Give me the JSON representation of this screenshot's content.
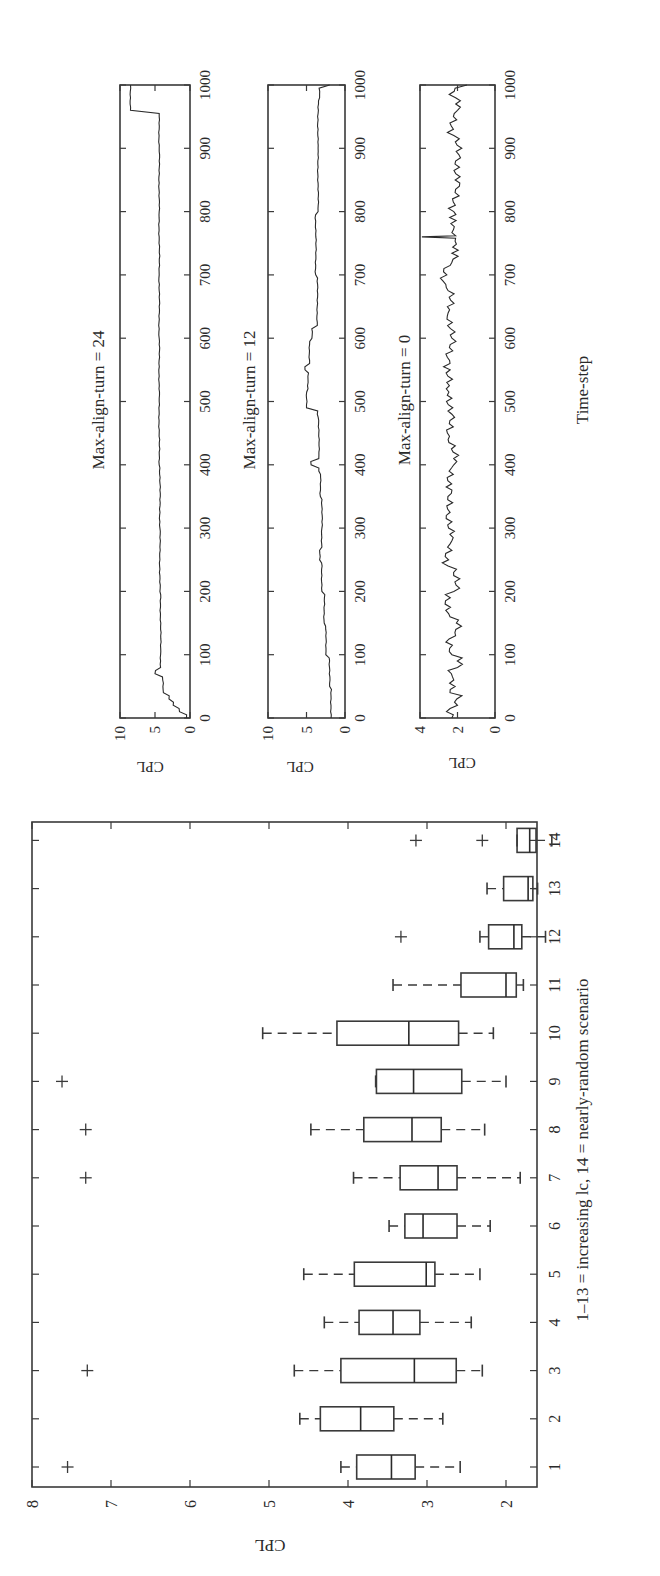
{
  "figure": {
    "orientation": "rotated 90 degrees counter-clockwise",
    "colors": {
      "ink": "#2a2a2a",
      "background": "#ffffff"
    }
  },
  "chart_data": [
    {
      "type": "box",
      "title": "",
      "xlabel": "1–13 = increasing lc, 14 = nearly-random scenario",
      "ylabel": "CPL",
      "ylim": [
        1.1,
        8
      ],
      "yticks": [
        2,
        3,
        4,
        5,
        6,
        7,
        8
      ],
      "categories": [
        "1",
        "2",
        "3",
        "4",
        "5",
        "6",
        "7",
        "8",
        "9",
        "10",
        "11",
        "12",
        "13",
        "14"
      ],
      "boxes": [
        {
          "cat": "1",
          "whisker_low": 2.58,
          "q1": 3.15,
          "median": 3.45,
          "q3": 3.89,
          "whisker_high": 4.09,
          "outliers": [
            7.55
          ]
        },
        {
          "cat": "2",
          "whisker_low": 2.8,
          "q1": 3.42,
          "median": 3.84,
          "q3": 4.35,
          "whisker_high": 4.61,
          "outliers": []
        },
        {
          "cat": "3",
          "whisker_low": 2.3,
          "q1": 2.63,
          "median": 3.16,
          "q3": 4.09,
          "whisker_high": 4.68,
          "outliers": [
            7.3
          ]
        },
        {
          "cat": "4",
          "whisker_low": 2.44,
          "q1": 3.09,
          "median": 3.43,
          "q3": 3.86,
          "whisker_high": 4.3,
          "outliers": []
        },
        {
          "cat": "5",
          "whisker_low": 2.33,
          "q1": 2.9,
          "median": 3.01,
          "q3": 3.92,
          "whisker_high": 4.56,
          "outliers": []
        },
        {
          "cat": "6",
          "whisker_low": 2.2,
          "q1": 2.62,
          "median": 3.05,
          "q3": 3.28,
          "whisker_high": 3.48,
          "outliers": []
        },
        {
          "cat": "7",
          "whisker_low": 1.82,
          "q1": 2.62,
          "median": 2.86,
          "q3": 3.34,
          "whisker_high": 3.93,
          "outliers": [
            7.32
          ]
        },
        {
          "cat": "8",
          "whisker_low": 2.27,
          "q1": 2.82,
          "median": 3.19,
          "q3": 3.8,
          "whisker_high": 4.47,
          "outliers": [
            7.32
          ]
        },
        {
          "cat": "9",
          "whisker_low": 2.0,
          "q1": 2.56,
          "median": 3.17,
          "q3": 3.64,
          "whisker_high": 3.65,
          "outliers": [
            7.62
          ]
        },
        {
          "cat": "10",
          "whisker_low": 2.16,
          "q1": 2.6,
          "median": 3.23,
          "q3": 4.14,
          "whisker_high": 5.08,
          "outliers": []
        },
        {
          "cat": "11",
          "whisker_low": 1.78,
          "q1": 1.87,
          "median": 2.0,
          "q3": 2.57,
          "whisker_high": 3.43,
          "outliers": []
        },
        {
          "cat": "12",
          "whisker_low": 1.5,
          "q1": 1.8,
          "median": 1.9,
          "q3": 2.22,
          "whisker_high": 2.33,
          "outliers": [
            3.33
          ]
        },
        {
          "cat": "13",
          "whisker_low": 1.6,
          "q1": 1.66,
          "median": 1.72,
          "q3": 2.03,
          "whisker_high": 2.24,
          "outliers": []
        },
        {
          "cat": "14",
          "whisker_low": 1.42,
          "q1": 1.62,
          "median": 1.7,
          "q3": 1.86,
          "whisker_high": 1.86,
          "outliers": [
            3.14,
            2.3
          ]
        }
      ]
    },
    {
      "type": "line",
      "title": "Max-align-turn = 24",
      "xlabel": "",
      "ylabel": "CPL",
      "xlim": [
        0,
        1000
      ],
      "ylim": [
        0,
        10
      ],
      "xticks": [
        0,
        100,
        200,
        300,
        400,
        500,
        600,
        700,
        800,
        900,
        1000
      ],
      "yticks": [
        0,
        5,
        10
      ],
      "series": [
        {
          "name": "CPL",
          "x": [
            0,
            10,
            20,
            30,
            40,
            60,
            70,
            80,
            100,
            200,
            300,
            400,
            500,
            600,
            700,
            800,
            900,
            950,
            960,
            1000
          ],
          "y": [
            0.5,
            1.5,
            2.4,
            3.0,
            3.8,
            3.9,
            5.0,
            4.2,
            4.2,
            4.3,
            4.3,
            4.4,
            4.4,
            4.4,
            4.4,
            4.4,
            4.4,
            4.4,
            8.5,
            8.5
          ]
        }
      ]
    },
    {
      "type": "line",
      "title": "Max-align-turn = 12",
      "xlabel": "",
      "ylabel": "CPL",
      "xlim": [
        0,
        1000
      ],
      "ylim": [
        0,
        10
      ],
      "xticks": [
        0,
        100,
        200,
        300,
        400,
        500,
        600,
        700,
        800,
        900,
        1000
      ],
      "yticks": [
        0,
        5,
        10
      ],
      "series": [
        {
          "name": "CPL",
          "x": [
            0,
            50,
            100,
            150,
            200,
            250,
            270,
            300,
            350,
            390,
            400,
            410,
            480,
            490,
            520,
            550,
            560,
            600,
            620,
            700,
            800,
            900,
            980,
            1000
          ],
          "y": [
            1.8,
            2.0,
            2.5,
            2.7,
            3.0,
            3.3,
            3.0,
            3.0,
            3.2,
            3.4,
            4.4,
            3.4,
            3.6,
            5.0,
            4.8,
            5.2,
            4.6,
            4.3,
            3.6,
            3.8,
            3.5,
            3.5,
            3.3,
            2.0
          ]
        }
      ]
    },
    {
      "type": "line",
      "title": "Max-align-turn = 0",
      "xlabel": "Time-step",
      "ylabel": "CPL",
      "xlim": [
        0,
        1000
      ],
      "ylim": [
        0,
        4
      ],
      "xticks": [
        0,
        100,
        200,
        300,
        400,
        500,
        600,
        700,
        800,
        900,
        1000
      ],
      "yticks": [
        0,
        2,
        4
      ],
      "series": [
        {
          "name": "CPL",
          "x": [
            0,
            20,
            40,
            60,
            80,
            100,
            130,
            160,
            200,
            240,
            280,
            320,
            360,
            400,
            440,
            480,
            520,
            560,
            600,
            640,
            680,
            720,
            758,
            760,
            762,
            800,
            840,
            880,
            920,
            960,
            980,
            1000
          ],
          "y": [
            2.3,
            2.0,
            2.4,
            2.2,
            2.0,
            2.3,
            2.1,
            2.4,
            2.2,
            2.5,
            2.3,
            2.6,
            2.3,
            2.2,
            2.5,
            2.3,
            2.6,
            2.4,
            2.3,
            2.5,
            2.6,
            2.3,
            2.1,
            3.9,
            2.1,
            2.2,
            1.9,
            2.1,
            2.2,
            2.0,
            2.1,
            1.5
          ]
        }
      ]
    }
  ],
  "labels": {
    "box_ylabel": "CPL",
    "box_xlabel": "1–13 = increasing lc, 14 = nearly-random scenario",
    "panel1_title": "Max-align-turn = 24",
    "panel2_title": "Max-align-turn = 12",
    "panel3_title": "Max-align-turn = 0",
    "panel_ylabel": "CPL",
    "time_xlabel": "Time-step"
  }
}
